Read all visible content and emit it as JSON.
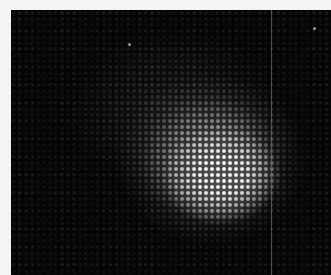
{
  "image": {
    "description": "Grayscale halftone-patterned photograph of a bright diffuse blob on a dark background",
    "colors": {
      "border": "#f4f4f4",
      "background": "#0d0d0d",
      "highlight": "#ffffff"
    }
  }
}
